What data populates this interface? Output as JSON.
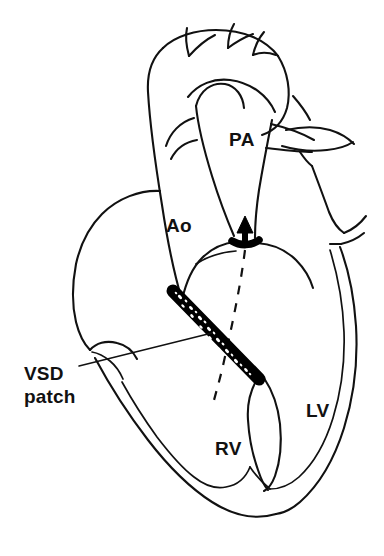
{
  "figure": {
    "background_color": "#ffffff",
    "ink_color": "#111111",
    "patch_color": "#000000",
    "width": 384,
    "height": 556
  },
  "labels": {
    "pa": "PA",
    "ao": "Ao",
    "lv": "LV",
    "rv": "RV",
    "vsd_line1": "VSD",
    "vsd_line2": "patch"
  },
  "annotations": {
    "leader_description": "leader line from VSD patch text to the patch band",
    "arrow_description": "solid black arrow showing flow direction upward into the pulmonary artery",
    "dashed_description": "dashed line marking the baffled flow path from the left ventricle"
  },
  "structures": [
    {
      "name": "aortic-arch",
      "label": "Ao"
    },
    {
      "name": "pulmonary-artery",
      "label": "PA"
    },
    {
      "name": "left-ventricle",
      "label": "LV"
    },
    {
      "name": "right-ventricle",
      "label": "RV"
    },
    {
      "name": "vsd-patch",
      "label": "VSD patch"
    }
  ]
}
